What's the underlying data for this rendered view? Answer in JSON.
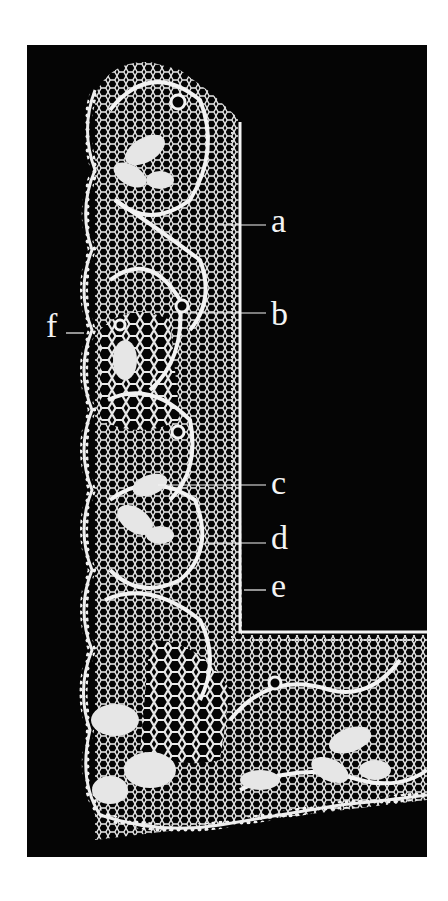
{
  "figure": {
    "background_color": "#050505",
    "lace_color": "#efefef",
    "page_color": "#ffffff"
  },
  "labels": [
    {
      "id": "a",
      "text": "a"
    },
    {
      "id": "b",
      "text": "b"
    },
    {
      "id": "c",
      "text": "c"
    },
    {
      "id": "d",
      "text": "d"
    },
    {
      "id": "e",
      "text": "e"
    },
    {
      "id": "f",
      "text": "f"
    }
  ]
}
